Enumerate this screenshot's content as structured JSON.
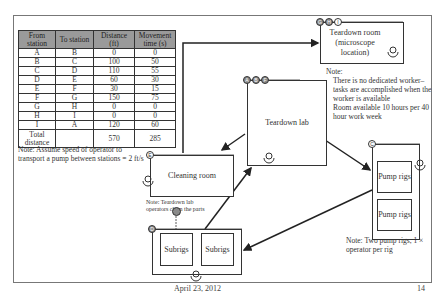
{
  "table": {
    "headers": [
      "From station",
      "To station",
      "Distance (ft)",
      "Movement time (s)"
    ],
    "rows": [
      [
        "A",
        "B",
        "0",
        "0"
      ],
      [
        "B",
        "C",
        "100",
        "50"
      ],
      [
        "C",
        "D",
        "110",
        "55"
      ],
      [
        "D",
        "E",
        "60",
        "30"
      ],
      [
        "E",
        "F",
        "30",
        "15"
      ],
      [
        "F",
        "G",
        "150",
        "75"
      ],
      [
        "G",
        "H",
        "0",
        "0"
      ],
      [
        "H",
        "I",
        "0",
        "0"
      ],
      [
        "I",
        "A",
        "120",
        "60"
      ]
    ],
    "total": {
      "label": "Total distance",
      "distance": "570",
      "time": "285"
    }
  },
  "notes": {
    "speed": "Note: Assume speed of operator to transport a pump between stations = 2 ft/s",
    "teardown_room_title": "Note:",
    "teardown_room_bullets": [
      "There is no dedicated worker–tasks are accomplished when the worker is available",
      "Room available 10 hours per 40 hour work week"
    ],
    "cleaning": "Note: Teardown lab operators clean the parts",
    "pump_rigs": "Note: Two pump rigs, 1 × operator per rig"
  },
  "stations": {
    "teardown_room": {
      "label": "Teardown room (microscope location)",
      "markers": [
        "G",
        "H",
        "I"
      ]
    },
    "teardown_lab": {
      "label": "Teardown lab",
      "markers": [
        "A",
        "B",
        "F"
      ]
    },
    "cleaning_room": {
      "label": "Cleaning room",
      "markers": [
        "E"
      ]
    },
    "pump_rigs": {
      "markers": [
        "C"
      ],
      "rigs": [
        "Pump rigs",
        "Pump rigs"
      ]
    },
    "subrigs": {
      "markers": [
        "D"
      ],
      "rigs": [
        "Subrigs",
        "Subrigs"
      ]
    }
  },
  "footer": {
    "date": "April 23, 2012",
    "page": "14"
  }
}
